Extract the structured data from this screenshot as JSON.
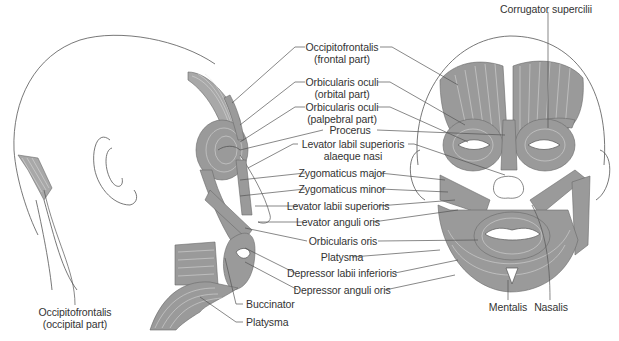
{
  "figure": {
    "views": [
      "posterolateral-head",
      "lateral-face",
      "anterior-face"
    ]
  },
  "labels": {
    "center": [
      {
        "id": "occipitofrontalis-frontal",
        "line1": "Occipitofrontalis",
        "line2": "(frontal part)"
      },
      {
        "id": "orbicularis-oculi-orbital",
        "line1": "Orbicularis oculi",
        "line2": "(orbital part)"
      },
      {
        "id": "orbicularis-oculi-palpebral",
        "line1": "Orbicularis oculi",
        "line2": "(palpebral part)"
      },
      {
        "id": "procerus",
        "line1": "Procerus"
      },
      {
        "id": "levator-labii-sup-alaeque-nasi",
        "line1": "Levator labil superioris",
        "line2": "alaeque nasi"
      },
      {
        "id": "zygomaticus-major",
        "line1": "Zygomaticus major"
      },
      {
        "id": "zygomaticus-minor",
        "line1": "Zygomaticus minor"
      },
      {
        "id": "levator-labii-superioris",
        "line1": "Levator labii superioris"
      },
      {
        "id": "levator-anguli-oris",
        "line1": "Levator anguli oris"
      },
      {
        "id": "orbicularis-oris",
        "line1": "Orbicularis oris"
      },
      {
        "id": "platysma-center",
        "line1": "Platysma"
      },
      {
        "id": "depressor-labii-inferioris",
        "line1": "Depressor labii inferioris"
      },
      {
        "id": "depressor-anguli-oris",
        "line1": "Depressor anguli oris"
      }
    ],
    "lateral": {
      "buccinator": "Buccinator",
      "platysma": "Platysma"
    },
    "occipital": {
      "line1": "Occipitofrontalis",
      "line2": "(occipital part)"
    },
    "anterior": {
      "corrugator": "Corrugator supercilii",
      "mentalis": "Mentalis",
      "nasalis": "Nasalis"
    }
  },
  "colors": {
    "muscle": "#9a9a9a",
    "outline": "#555555",
    "text": "#333333",
    "background": "#ffffff"
  }
}
